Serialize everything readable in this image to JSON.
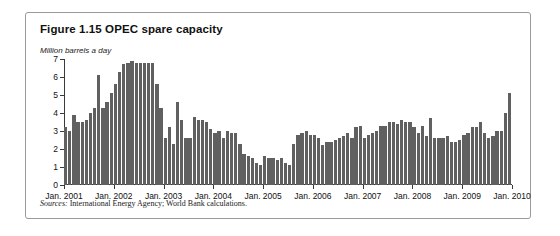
{
  "figure": {
    "title": "Figure 1.15  OPEC spare capacity",
    "units_label": "Million barrels a day",
    "source_prefix": "Sources:",
    "source_text": " International Energy Agency; World Bank calculations."
  },
  "colors": {
    "bar": "#606060",
    "axis": "#3a3a3a",
    "frame": "#9a9a9a",
    "background": "#ffffff"
  },
  "chart_data": {
    "type": "bar",
    "title": "Figure 1.15  OPEC spare capacity",
    "subtitle": "Million barrels a day",
    "xlabel": "",
    "ylabel": "Million barrels a day",
    "ylim": [
      0,
      7
    ],
    "yticks": [
      0,
      1,
      2,
      3,
      4,
      5,
      6,
      7
    ],
    "ytick_labels": [
      "0",
      "1",
      "2",
      "3",
      "4",
      "5",
      "6",
      "7"
    ],
    "grid": false,
    "legend": "none",
    "x_tick_labels": [
      "Jan. 2001",
      "Jan. 2002",
      "Jan. 2003",
      "Jan. 2004",
      "Jan. 2005",
      "Jan. 2006",
      "Jan. 2007",
      "Jan. 2008",
      "Jan. 2009",
      "Jan. 2010"
    ],
    "x_tick_index": [
      0,
      12,
      24,
      36,
      48,
      60,
      72,
      84,
      96,
      108
    ],
    "frequency": "monthly",
    "x_start": "Jan. 2001",
    "x_end": "Dec. 2009",
    "categories": [
      "Jan. 2001",
      "Feb. 2001",
      "Mar. 2001",
      "Apr. 2001",
      "May 2001",
      "Jun. 2001",
      "Jul. 2001",
      "Aug. 2001",
      "Sep. 2001",
      "Oct. 2001",
      "Nov. 2001",
      "Dec. 2001",
      "Jan. 2002",
      "Feb. 2002",
      "Mar. 2002",
      "Apr. 2002",
      "May 2002",
      "Jun. 2002",
      "Jul. 2002",
      "Aug. 2002",
      "Sep. 2002",
      "Oct. 2002",
      "Nov. 2002",
      "Dec. 2002",
      "Jan. 2003",
      "Feb. 2003",
      "Mar. 2003",
      "Apr. 2003",
      "May 2003",
      "Jun. 2003",
      "Jul. 2003",
      "Aug. 2003",
      "Sep. 2003",
      "Oct. 2003",
      "Nov. 2003",
      "Dec. 2003",
      "Jan. 2004",
      "Feb. 2004",
      "Mar. 2004",
      "Apr. 2004",
      "May 2004",
      "Jun. 2004",
      "Jul. 2004",
      "Aug. 2004",
      "Sep. 2004",
      "Oct. 2004",
      "Nov. 2004",
      "Dec. 2004",
      "Jan. 2005",
      "Feb. 2005",
      "Mar. 2005",
      "Apr. 2005",
      "May 2005",
      "Jun. 2005",
      "Jul. 2005",
      "Aug. 2005",
      "Sep. 2005",
      "Oct. 2005",
      "Nov. 2005",
      "Dec. 2005",
      "Jan. 2006",
      "Feb. 2006",
      "Mar. 2006",
      "Apr. 2006",
      "May 2006",
      "Jun. 2006",
      "Jul. 2006",
      "Aug. 2006",
      "Sep. 2006",
      "Oct. 2006",
      "Nov. 2006",
      "Dec. 2006",
      "Jan. 2007",
      "Feb. 2007",
      "Mar. 2007",
      "Apr. 2007",
      "May 2007",
      "Jun. 2007",
      "Jul. 2007",
      "Aug. 2007",
      "Sep. 2007",
      "Oct. 2007",
      "Nov. 2007",
      "Dec. 2007",
      "Jan. 2008",
      "Feb. 2008",
      "Mar. 2008",
      "Apr. 2008",
      "May 2008",
      "Jun. 2008",
      "Jul. 2008",
      "Aug. 2008",
      "Sep. 2008",
      "Oct. 2008",
      "Nov. 2008",
      "Dec. 2008",
      "Jan. 2009",
      "Feb. 2009",
      "Mar. 2009",
      "Apr. 2009",
      "May 2009",
      "Jun. 2009",
      "Jul. 2009",
      "Aug. 2009",
      "Sep. 2009",
      "Oct. 2009",
      "Nov. 2009",
      "Dec. 2009"
    ],
    "values": [
      3.2,
      3.0,
      3.9,
      3.5,
      3.5,
      3.6,
      4.0,
      4.3,
      6.1,
      4.3,
      4.6,
      5.1,
      5.6,
      6.3,
      6.7,
      6.8,
      6.9,
      6.8,
      6.8,
      6.8,
      6.8,
      6.8,
      5.6,
      4.3,
      2.6,
      3.2,
      2.3,
      4.6,
      3.6,
      2.6,
      2.6,
      3.8,
      3.6,
      3.6,
      3.5,
      3.1,
      2.9,
      3.0,
      2.6,
      3.0,
      2.9,
      2.9,
      2.3,
      1.7,
      1.6,
      1.5,
      1.2,
      1.1,
      1.6,
      1.5,
      1.5,
      1.4,
      1.5,
      1.2,
      1.1,
      2.3,
      2.8,
      2.9,
      3.0,
      2.8,
      2.8,
      2.6,
      2.2,
      2.4,
      2.4,
      2.5,
      2.6,
      2.7,
      2.9,
      2.6,
      3.2,
      3.3,
      2.6,
      2.8,
      2.9,
      3.0,
      3.3,
      3.3,
      3.5,
      3.5,
      3.4,
      3.6,
      3.5,
      3.5,
      3.2,
      2.9,
      3.3,
      2.7,
      3.7,
      2.6,
      2.6,
      2.6,
      2.7,
      2.4,
      2.4,
      2.5,
      2.8,
      2.9,
      3.2,
      3.2,
      3.5,
      2.9,
      2.6,
      2.7,
      3.0,
      3.0,
      4.0,
      5.1
    ]
  }
}
